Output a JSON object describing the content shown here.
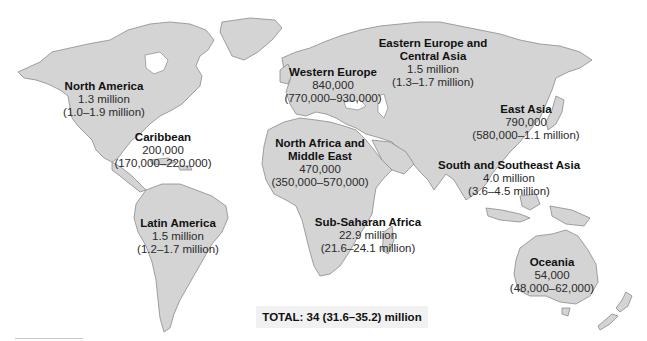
{
  "map": {
    "land_color": "#d4d4d4",
    "border_color": "#8a8a8a",
    "background_color": "#ffffff"
  },
  "regions": [
    {
      "id": "north-america",
      "name": "North America",
      "value": "1.3 million",
      "range": "(1.0–1.9 million)"
    },
    {
      "id": "caribbean",
      "name": "Caribbean",
      "value": "200,000",
      "range": "(170,000–220,000)"
    },
    {
      "id": "latin-america",
      "name": "Latin America",
      "value": "1.5 million",
      "range": "(1.2–1.7 million)"
    },
    {
      "id": "western-europe",
      "name": "Western Europe",
      "value": "840,000",
      "range": "(770,000–930,000)"
    },
    {
      "id": "eastern-europe-central-asia",
      "name": "Eastern Europe and",
      "name2": "Central Asia",
      "value": "1.5 million",
      "range": "(1.3–1.7 million)"
    },
    {
      "id": "east-asia",
      "name": "East Asia",
      "value": "790,000",
      "range": "(580,000–1.1 million)"
    },
    {
      "id": "north-africa-middle-east",
      "name": "North Africa and",
      "name2": "Middle East",
      "value": "470,000",
      "range": "(350,000–570,000)"
    },
    {
      "id": "south-southeast-asia",
      "name": "South and Southeast Asia",
      "value": "4.0 million",
      "range": "(3.6–4.5 million)"
    },
    {
      "id": "sub-saharan-africa",
      "name": "Sub-Saharan Africa",
      "value": "22.9 million",
      "range": "(21.6–24.1 million)"
    },
    {
      "id": "oceania",
      "name": "Oceania",
      "value": "54,000",
      "range": "(48,000–62,000)"
    }
  ],
  "total": {
    "label": "TOTAL: 34 (31.6–35.2) million"
  }
}
